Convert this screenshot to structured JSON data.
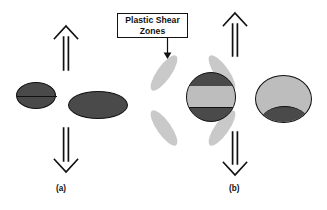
{
  "figure": {
    "background_color": "#ffffff",
    "width": 327,
    "height": 210
  },
  "colors": {
    "outline": "#111111",
    "dark_fill": "#4a4a4a",
    "light_fill": "#bdbdbd",
    "shear_zone_fill": "#c9c9c9",
    "callout_background": "#ffffff"
  },
  "callout": {
    "name": "plastic-shear-zones-callout",
    "line1": "Plastic Shear",
    "line2": "Zones",
    "pointer_icon": "down-arrow-icon"
  },
  "panels": [
    {
      "id": "a",
      "label": "(a)",
      "top_arrow_icon": "up-arrow-icon",
      "bottom_arrow_icon": "down-arrow-icon",
      "particles": [
        {
          "name": "small-dark-ellipse",
          "fill": "#4a4a4a",
          "has_mid_line": true
        },
        {
          "name": "large-dark-ellipse",
          "fill": "#4a4a4a",
          "has_mid_line": false
        }
      ]
    },
    {
      "id": "b",
      "label": "(b)",
      "top_arrow_icon": "up-arrow-icon",
      "bottom_arrow_icon": "down-arrow-icon",
      "particles": [
        {
          "name": "banded-circle",
          "fill": "#4a4a4a",
          "band_fill": "#bdbdbd",
          "shear_zone_count": 4
        },
        {
          "name": "light-ellipse-with-basal-cap",
          "fill": "#bdbdbd",
          "cap_fill": "#4a4a4a"
        }
      ]
    }
  ]
}
